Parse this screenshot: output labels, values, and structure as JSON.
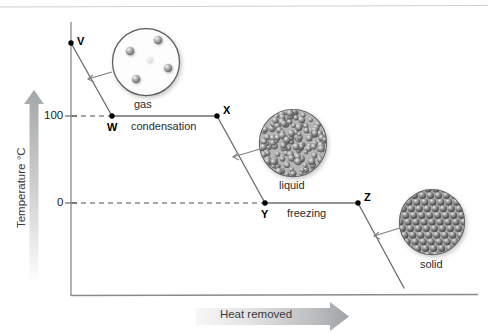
{
  "figure": {
    "type": "cooling-curve-diagram",
    "title_visible": false
  },
  "axes": {
    "y": {
      "label": "Temperature °C",
      "ticks": [
        {
          "value": "100",
          "y_px": 116
        },
        {
          "value": "0",
          "y_px": 203
        }
      ],
      "arrow_direction": "up"
    },
    "x": {
      "label": "Heat removed",
      "arrow_direction": "right",
      "ticks": []
    }
  },
  "curve_points": [
    {
      "id": "V",
      "label": "V",
      "x_px": 71,
      "y_px": 43
    },
    {
      "id": "W",
      "label": "W",
      "x_px": 112,
      "y_px": 116
    },
    {
      "id": "X",
      "label": "X",
      "x_px": 217,
      "y_px": 116
    },
    {
      "id": "Y",
      "label": "Y",
      "x_px": 265,
      "y_px": 203
    },
    {
      "id": "Z",
      "label": "Z",
      "x_px": 358,
      "y_px": 203
    }
  ],
  "process_labels": [
    {
      "text": "condensation",
      "x_px": 131,
      "y_px": 121
    },
    {
      "text": "freezing",
      "x_px": 287,
      "y_px": 208
    }
  ],
  "phase_callouts": [
    {
      "name": "gas",
      "label": "gas",
      "label_x_px": 146,
      "label_y_px": 98,
      "circle": {
        "cx": 146,
        "cy": 62,
        "r": 34
      },
      "particle_style": "sparse-spheres",
      "particle_count": 5
    },
    {
      "name": "liquid",
      "label": "liquid",
      "label_x_px": 293,
      "label_y_px": 178,
      "circle": {
        "cx": 293,
        "cy": 143,
        "r": 34
      },
      "particle_style": "dense-random-spheres",
      "particle_count": 160
    },
    {
      "name": "solid",
      "label": "solid",
      "label_x_px": 432,
      "label_y_px": 258,
      "circle": {
        "cx": 432,
        "cy": 222,
        "r": 33
      },
      "particle_style": "ordered-lattice-spheres",
      "particle_count": 60
    }
  ],
  "colors": {
    "line": "#6f6f6f",
    "point": "#000000",
    "axis": "#8a8a8a",
    "dashed_guide": "#555555",
    "arrow_light": "#f2f2f2",
    "arrow_dark": "#9a9a9a",
    "text": "#1a1a1a",
    "gas_particle": "#8c8c8c",
    "liquid_particle": "#777777",
    "solid_particle": "#6b6b6b",
    "background": "#ffffff"
  }
}
